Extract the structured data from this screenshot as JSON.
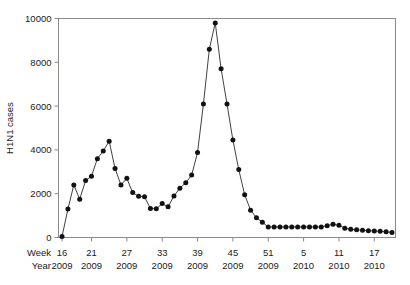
{
  "figure": {
    "caption": ""
  },
  "axes": {
    "ylabel": "H1N1 cases",
    "week_row_label": "Week",
    "year_row_label": "Year",
    "ytick_labels": [
      "0",
      "2000",
      "4000",
      "6000",
      "8000",
      "10000"
    ],
    "xtick_weeks": [
      "16",
      "21",
      "27",
      "33",
      "39",
      "45",
      "51",
      "5",
      "11",
      "17"
    ],
    "xtick_years": [
      "2009",
      "2009",
      "2009",
      "2009",
      "2009",
      "2009",
      "2009",
      "2010",
      "2010",
      "2010"
    ]
  },
  "chart_data": {
    "type": "line",
    "title": "",
    "xlabel": "Week / Year",
    "ylabel": "H1N1 cases",
    "ylim": [
      0,
      10000
    ],
    "yticks": [
      0,
      2000,
      4000,
      6000,
      8000,
      10000
    ],
    "grid": false,
    "legend": "none",
    "marker": "filled-circle",
    "xtick_positions": [
      16,
      21,
      27,
      33,
      39,
      45,
      51,
      57,
      63,
      69
    ],
    "xtick_labels_week": [
      "16",
      "21",
      "27",
      "33",
      "39",
      "45",
      "51",
      "5",
      "11",
      "17"
    ],
    "xtick_labels_year": [
      "2009",
      "2009",
      "2009",
      "2009",
      "2009",
      "2009",
      "2009",
      "2010",
      "2010",
      "2010"
    ],
    "x": [
      16,
      17,
      18,
      19,
      20,
      21,
      22,
      23,
      24,
      25,
      26,
      27,
      28,
      29,
      30,
      31,
      32,
      33,
      34,
      35,
      36,
      37,
      38,
      39,
      40,
      41,
      42,
      43,
      44,
      45,
      46,
      47,
      48,
      49,
      50,
      51,
      52,
      53,
      54,
      55,
      56,
      57,
      58,
      59,
      60,
      61,
      62,
      63,
      64,
      65,
      66,
      67,
      68,
      69,
      70,
      71,
      72
    ],
    "values": [
      40,
      1300,
      2400,
      1750,
      2600,
      2800,
      3600,
      3950,
      4400,
      3150,
      2400,
      2700,
      2050,
      1880,
      1860,
      1320,
      1310,
      1550,
      1400,
      1900,
      2250,
      2500,
      2850,
      3880,
      6100,
      8600,
      9800,
      7700,
      6100,
      4450,
      3100,
      1950,
      1250,
      900,
      700,
      480,
      480,
      480,
      480,
      480,
      480,
      480,
      480,
      480,
      480,
      540,
      600,
      560,
      420,
      380,
      350,
      330,
      310,
      300,
      280,
      260,
      230
    ],
    "series_name": "H1N1 cases"
  }
}
